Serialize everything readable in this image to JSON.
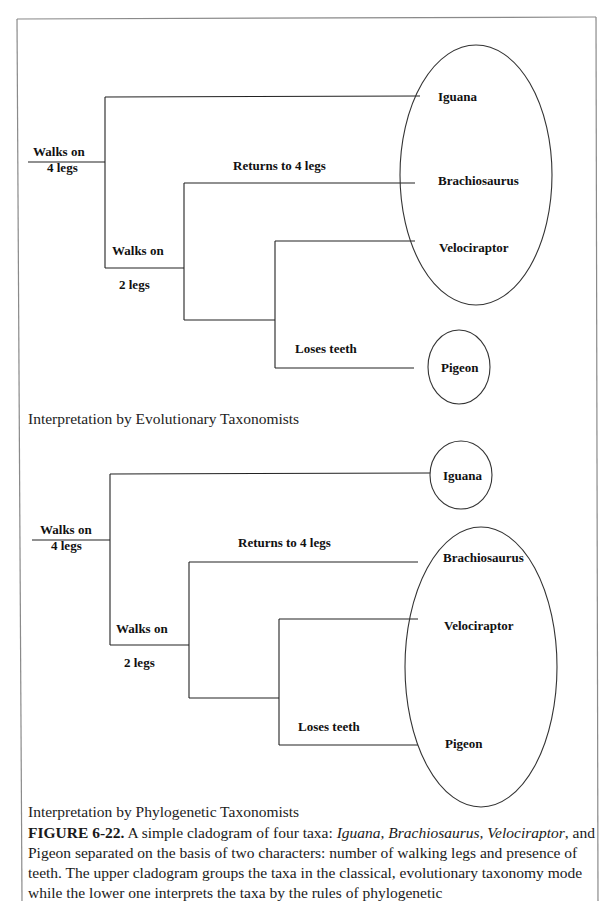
{
  "figure": {
    "upper": {
      "title": "Interpretation by Evolutionary Taxonomists",
      "characters": {
        "root_top": "Walks on",
        "root_bottom": "4 legs",
        "node2_top": "Walks on",
        "node2_bottom": "2 legs",
        "returns": "Returns to 4 legs",
        "loses_teeth": "Loses teeth"
      },
      "taxa": [
        "Iguana",
        "Brachiosaurus",
        "Velociraptor",
        "Pigeon"
      ],
      "groups": [
        [
          "Iguana",
          "Brachiosaurus",
          "Velociraptor"
        ],
        [
          "Pigeon"
        ]
      ]
    },
    "lower": {
      "title": "Interpretation by Phylogenetic Taxonomists",
      "characters": {
        "root_top": "Walks on",
        "root_bottom": "4 legs",
        "node2_top": "Walks on",
        "node2_bottom": "2 legs",
        "returns": "Returns to 4 legs",
        "loses_teeth": "Loses teeth"
      },
      "taxa": [
        "Iguana",
        "Brachiosaurus",
        "Velociraptor",
        "Pigeon"
      ],
      "groups": [
        [
          "Iguana"
        ],
        [
          "Brachiosaurus",
          "Velociraptor",
          "Pigeon"
        ]
      ]
    },
    "caption": {
      "label": "FIGURE 6-22.",
      "part1": " A simple cladogram of four taxa: ",
      "italic_taxa": "Iguana, Brachiosaurus, Velociraptor",
      "part2": ", and Pigeon separated on the basis of two characters: number of walking legs and presence of teeth.  The upper cladogram groups the taxa in the classical, evolutionary taxonomy mode while the lower one interprets the taxa by the rules of phylogenetic"
    }
  },
  "colors": {
    "line": "#222222",
    "frame": "#888888",
    "background": "#ffffff"
  }
}
